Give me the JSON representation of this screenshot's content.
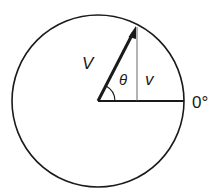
{
  "diagram": {
    "colors": {
      "stroke": "#1a1a1a",
      "background": "#ffffff"
    },
    "labels": {
      "phasor": "V",
      "angle": "θ",
      "vertical_component": "v",
      "reference": "0°"
    },
    "geometry": {
      "center": [
        98,
        101
      ],
      "radius": 86,
      "arrow_tip": [
        136,
        27
      ]
    }
  }
}
